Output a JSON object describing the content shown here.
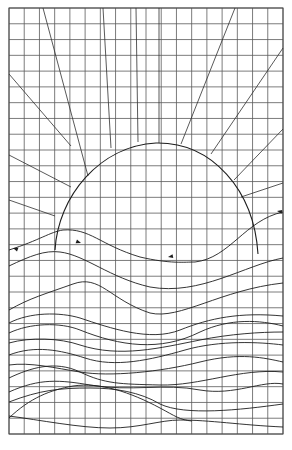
{
  "drawing": {
    "title": "Sunset over waves — grid line drawing",
    "colors": {
      "background": "#ffffff",
      "grid": "#5a5a5a",
      "line": "#1e1e1e"
    },
    "grid": {
      "left": 9,
      "top": 8,
      "right": 283,
      "bottom": 434,
      "columns": 18,
      "rows": 27
    },
    "sun": {
      "shape": "semicircle",
      "path": "M 55 250 C 58 196, 100 146, 156 143 C 212 142, 254 190, 258 254"
    },
    "rays": [
      {
        "id": "ray-1",
        "x1": 9,
        "y1": 74,
        "x2": 71,
        "y2": 146
      },
      {
        "id": "ray-2",
        "x1": 43,
        "y1": 8,
        "x2": 88,
        "y2": 176
      },
      {
        "id": "ray-3",
        "x1": 103,
        "y1": 8,
        "x2": 111,
        "y2": 148
      },
      {
        "id": "ray-4",
        "x1": 136,
        "y1": 8,
        "x2": 138,
        "y2": 142
      },
      {
        "id": "ray-5",
        "x1": 159,
        "y1": 8,
        "x2": 159,
        "y2": 143
      },
      {
        "id": "ray-6",
        "x1": 235,
        "y1": 8,
        "x2": 181,
        "y2": 144
      },
      {
        "id": "ray-7",
        "x1": 283,
        "y1": 48,
        "x2": 211,
        "y2": 154
      },
      {
        "id": "ray-8",
        "x1": 283,
        "y1": 129,
        "x2": 234,
        "y2": 180
      },
      {
        "id": "ray-9",
        "x1": 283,
        "y1": 183,
        "x2": 241,
        "y2": 197
      },
      {
        "id": "ray-10",
        "x1": 9,
        "y1": 155,
        "x2": 71,
        "y2": 187
      },
      {
        "id": "ray-11",
        "x1": 9,
        "y1": 200,
        "x2": 55,
        "y2": 216
      }
    ],
    "waves": [
      {
        "id": "wave-1",
        "d": "M 9 250 C 40 240, 50 232, 63 230 C 90 228, 100 245, 140 257 C 170 264, 185 262, 195 262 C 230 258, 245 220, 283 212"
      },
      {
        "id": "wave-2",
        "d": "M 9 266 C 30 256, 45 250, 60 252 C 85 255, 110 278, 150 287 C 200 296, 245 265, 283 258"
      },
      {
        "id": "wave-3",
        "d": "M 9 310 C 30 298, 45 294, 73 284 C 100 274, 110 300, 150 313 C 180 320, 220 290, 283 283"
      },
      {
        "id": "wave-4",
        "d": "M 9 323 C 30 312, 60 312, 80 318 C 110 328, 150 342, 180 330 C 210 318, 240 312, 283 316"
      },
      {
        "id": "wave-5",
        "d": "M 9 333 C 30 323, 60 322, 80 330 C 120 346, 160 352, 200 332 C 230 318, 260 320, 283 326"
      },
      {
        "id": "wave-6",
        "d": "M 9 343 C 30 337, 60 338, 80 345 C 120 358, 160 348, 200 340 C 230 334, 260 332, 283 332"
      },
      {
        "id": "wave-7",
        "d": "M 9 355 C 35 345, 60 350, 85 358 C 115 368, 150 360, 185 350 C 220 340, 260 342, 283 345"
      },
      {
        "id": "wave-8",
        "d": "M 9 365 C 30 362, 55 368, 80 372 C 110 377, 160 372, 200 362 C 240 352, 265 358, 283 362"
      },
      {
        "id": "wave-9",
        "d": "M 9 378 C 30 368, 55 360, 80 372 C 105 384, 120 384, 160 385 C 200 386, 240 368, 283 372"
      },
      {
        "id": "wave-10",
        "d": "M 9 392 C 40 378, 60 380, 90 385 C 130 392, 165 383, 200 390 C 235 396, 262 380, 283 384"
      },
      {
        "id": "wave-11",
        "d": "M 9 402 C 40 390, 60 388, 90 388 C 115 388, 140 392, 160 404 C 185 416, 240 410, 283 404"
      },
      {
        "id": "wave-12",
        "d": "M 9 418 C 30 398, 50 390, 73 386 C 100 382, 130 392, 160 408 C 175 416, 180 420, 192 421"
      },
      {
        "id": "wave-13",
        "d": "M 9 416 C 40 420, 80 428, 110 428 C 140 428, 160 420, 180 420 C 210 420, 240 425, 283 427"
      }
    ],
    "arrows": [
      {
        "id": "arrow-left",
        "x": 13,
        "y": 248,
        "angle": 200
      },
      {
        "id": "arrow-mid",
        "x": 81,
        "y": 243,
        "angle": 20
      },
      {
        "id": "arrow-center",
        "x": 168,
        "y": 257,
        "angle": 170
      },
      {
        "id": "arrow-right",
        "x": 277,
        "y": 211,
        "angle": 190
      }
    ]
  }
}
